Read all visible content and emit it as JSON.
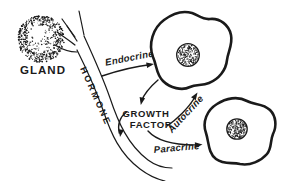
{
  "diagram": {
    "type": "cell-signaling-pathways",
    "colors": {
      "ink": "#1a1a1a",
      "background": "#ffffff"
    },
    "gland": {
      "label": "GLAND"
    },
    "vessel": {
      "label": "HORMONE"
    },
    "mediator": {
      "label_line1": "GROWTH",
      "label_line2": "FACTOR"
    },
    "pathways": {
      "endocrine": {
        "label": "Endocrine"
      },
      "autocrine": {
        "label": "Autocrine"
      },
      "paracrine": {
        "label": "Paracrine"
      }
    }
  }
}
